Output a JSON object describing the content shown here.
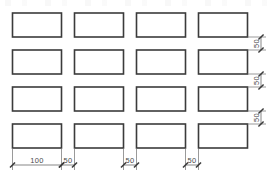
{
  "drawing": {
    "title": "Rectangular panel array layout",
    "units": "mm",
    "line_color": "#3b3b3b",
    "dim_color": "#4a4a4a",
    "background": "#ffffff",
    "grid": {
      "rows": 4,
      "columns": 4,
      "rect_width": 100,
      "rect_height": 50,
      "total_rectangles": 16
    },
    "horizontal_dimensions": [
      {
        "label": "100",
        "kind": "rect-width",
        "order": 1
      },
      {
        "label": "50",
        "kind": "gap",
        "order": 2
      },
      {
        "label": "50",
        "kind": "gap",
        "order": 3
      },
      {
        "label": "50",
        "kind": "gap",
        "order": 4
      }
    ],
    "vertical_dimensions": [
      {
        "label": "50",
        "kind": "gap",
        "order": 1
      },
      {
        "label": "50",
        "kind": "gap",
        "order": 2
      },
      {
        "label": "50",
        "kind": "gap",
        "order": 3
      }
    ]
  }
}
